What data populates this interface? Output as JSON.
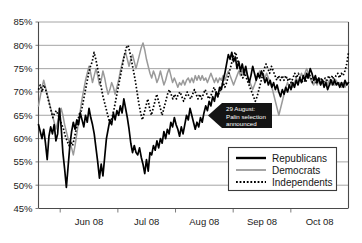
{
  "chart_data": {
    "type": "line",
    "title": "",
    "subtitle": "",
    "xlabel": "",
    "ylabel": "",
    "ylim": [
      45,
      85
    ],
    "ytick_values": [
      45,
      50,
      55,
      60,
      65,
      70,
      75,
      80,
      85
    ],
    "ytick_labels": [
      "45%",
      "50%",
      "55%",
      "60%",
      "65%",
      "70%",
      "75%",
      "80%",
      "85%"
    ],
    "xtick_labels": [
      "Jun 08",
      "Jul 08",
      "Aug 08",
      "Sep 08",
      "Oct 08"
    ],
    "x_range_note": "mid-May 2008 through late October 2008",
    "grid": true,
    "legend_position": "lower-right-inside",
    "annotations": [
      {
        "id": "palin-annotation",
        "line1": "29 August:",
        "line2": "Palin selection",
        "line3": "announced",
        "points_to_percent": 64,
        "style": "black-banner-left-arrow"
      }
    ],
    "series": [
      {
        "name": "Republicans",
        "style": "solid-black-thick",
        "color": "#000000",
        "values": [
          63.0,
          61.5,
          60.0,
          62.0,
          59.0,
          55.5,
          60.5,
          62.5,
          61.0,
          63.0,
          59.5,
          61.0,
          66.5,
          62.5,
          57.0,
          53.5,
          49.5,
          54.0,
          58.5,
          61.5,
          63.5,
          62.0,
          64.0,
          63.0,
          65.5,
          64.0,
          62.5,
          65.0,
          63.5,
          66.5,
          64.5,
          63.0,
          61.0,
          58.0,
          55.0,
          51.5,
          54.5,
          52.0,
          56.0,
          60.0,
          62.0,
          64.0,
          63.0,
          65.5,
          64.0,
          66.0,
          65.0,
          67.0,
          65.5,
          68.5,
          66.5,
          64.5,
          62.0,
          59.0,
          57.0,
          58.5,
          57.0,
          56.5,
          58.0,
          56.0,
          54.5,
          52.5,
          55.5,
          53.0,
          57.0,
          56.5,
          58.5,
          57.5,
          59.5,
          58.0,
          60.0,
          59.0,
          61.5,
          60.0,
          62.0,
          61.0,
          63.5,
          62.5,
          64.5,
          63.0,
          62.0,
          60.5,
          62.5,
          61.0,
          63.0,
          65.0,
          64.0,
          66.5,
          65.0,
          63.5,
          62.0,
          63.5,
          62.5,
          64.5,
          63.5,
          65.5,
          67.0,
          66.0,
          68.0,
          67.0,
          69.0,
          68.0,
          70.0,
          69.0,
          71.0,
          70.5,
          72.5,
          74.0,
          76.0,
          78.0,
          77.0,
          78.5,
          76.5,
          77.5,
          75.0,
          76.5,
          74.5,
          76.0,
          74.0,
          75.5,
          73.5,
          72.0,
          73.5,
          75.5,
          74.0,
          72.5,
          74.0,
          73.0,
          74.5,
          73.5,
          72.0,
          73.0,
          71.5,
          72.5,
          71.0,
          72.0,
          70.5,
          71.5,
          70.0,
          69.0,
          70.5,
          69.5,
          71.0,
          70.0,
          71.5,
          70.5,
          72.0,
          71.0,
          72.5,
          71.5,
          73.0,
          72.0,
          73.5,
          72.5,
          74.0,
          73.0,
          75.0,
          74.0,
          72.5,
          73.5,
          72.0,
          73.0,
          71.5,
          72.5,
          71.0,
          72.0,
          70.5,
          71.5,
          72.5,
          71.5,
          72.5,
          71.5,
          72.0,
          71.0,
          72.0,
          71.0,
          72.5,
          71.5,
          72.0
        ]
      },
      {
        "name": "Democrats",
        "style": "solid-gray-thin",
        "color": "#9a9a9a",
        "values": [
          67.0,
          69.0,
          71.0,
          72.5,
          71.0,
          69.5,
          68.0,
          66.5,
          65.0,
          63.5,
          62.0,
          63.5,
          65.0,
          66.5,
          65.0,
          63.0,
          61.5,
          60.0,
          59.0,
          58.0,
          56.5,
          58.5,
          61.0,
          63.5,
          66.0,
          68.5,
          70.5,
          72.5,
          74.0,
          75.5,
          74.0,
          72.0,
          73.5,
          75.0,
          73.5,
          71.5,
          72.5,
          74.5,
          73.0,
          71.0,
          69.5,
          70.5,
          72.0,
          71.0,
          69.5,
          71.0,
          72.5,
          74.5,
          76.0,
          77.5,
          78.5,
          77.0,
          75.5,
          77.0,
          78.0,
          76.5,
          75.0,
          76.5,
          78.0,
          79.5,
          80.5,
          79.0,
          77.0,
          75.5,
          74.0,
          73.0,
          74.5,
          73.5,
          72.0,
          73.0,
          74.5,
          73.0,
          71.5,
          72.5,
          74.0,
          75.0,
          73.5,
          72.0,
          73.0,
          72.0,
          71.0,
          72.0,
          71.5,
          72.5,
          71.5,
          72.5,
          73.0,
          72.0,
          73.0,
          72.0,
          73.5,
          72.5,
          73.5,
          72.5,
          73.5,
          72.5,
          73.0,
          72.0,
          73.0,
          74.0,
          73.0,
          72.0,
          73.0,
          72.0,
          73.0,
          72.5,
          73.5,
          72.5,
          73.5,
          74.5,
          73.5,
          72.5,
          71.5,
          72.5,
          73.5,
          74.5,
          73.5,
          74.5,
          73.5,
          74.5,
          73.5,
          72.5,
          71.5,
          70.5,
          71.5,
          72.5,
          73.5,
          74.5,
          73.5,
          74.0,
          73.0,
          74.0,
          73.0,
          72.0,
          71.0,
          69.5,
          68.0,
          66.5,
          65.0,
          66.5,
          68.0,
          69.5,
          71.0,
          72.0,
          71.0,
          72.0,
          71.0,
          72.0,
          73.0,
          72.0,
          73.0,
          74.0,
          73.0,
          74.0,
          75.0,
          74.0,
          73.0,
          72.0,
          71.5,
          72.5,
          71.5,
          72.5,
          71.5,
          72.5,
          71.5,
          72.5,
          71.5,
          72.5,
          71.5,
          72.5,
          71.5,
          72.5,
          71.5,
          72.0,
          71.0,
          72.0,
          71.0,
          72.0,
          71.5
        ]
      },
      {
        "name": "Independents",
        "style": "dotted-black",
        "color": "#000000",
        "values": [
          70.5,
          71.5,
          70.0,
          71.5,
          70.5,
          69.0,
          67.5,
          66.0,
          64.5,
          65.5,
          66.0,
          65.0,
          64.0,
          63.0,
          62.0,
          60.5,
          59.5,
          58.5,
          59.5,
          58.5,
          60.0,
          62.0,
          64.0,
          65.5,
          66.0,
          68.0,
          70.0,
          72.0,
          74.0,
          75.5,
          76.5,
          78.5,
          77.0,
          75.0,
          73.0,
          71.0,
          69.0,
          67.5,
          66.0,
          64.5,
          63.0,
          64.5,
          66.0,
          68.0,
          70.0,
          72.0,
          74.0,
          76.0,
          78.0,
          79.5,
          80.0,
          78.5,
          76.5,
          74.5,
          72.5,
          70.0,
          67.5,
          65.5,
          64.0,
          65.5,
          67.0,
          68.5,
          66.5,
          65.0,
          66.5,
          68.0,
          69.5,
          68.0,
          66.5,
          65.0,
          66.5,
          68.0,
          69.5,
          70.5,
          69.5,
          68.5,
          69.5,
          68.5,
          69.5,
          70.0,
          69.0,
          68.0,
          69.0,
          70.0,
          69.0,
          68.5,
          69.5,
          70.5,
          69.5,
          68.5,
          69.5,
          68.5,
          69.5,
          70.5,
          69.5,
          68.5,
          69.0,
          70.0,
          71.0,
          70.0,
          69.0,
          70.0,
          71.0,
          72.0,
          71.0,
          72.0,
          73.5,
          75.0,
          76.5,
          78.0,
          78.5,
          77.0,
          75.5,
          74.0,
          73.0,
          74.0,
          73.0,
          72.0,
          71.0,
          70.0,
          69.0,
          68.0,
          69.0,
          70.5,
          72.0,
          73.5,
          75.0,
          76.0,
          75.0,
          74.0,
          75.5,
          74.5,
          73.5,
          72.5,
          73.5,
          72.5,
          73.5,
          72.5,
          73.5,
          72.5,
          73.0,
          72.0,
          73.0,
          74.0,
          73.0,
          74.0,
          73.0,
          72.0,
          73.0,
          72.0,
          73.0,
          74.0,
          73.0,
          72.0,
          73.0,
          72.0,
          73.0,
          72.0,
          73.0,
          72.0,
          73.0,
          72.5,
          73.5,
          72.5,
          73.5,
          72.5,
          73.5,
          74.0,
          73.0,
          74.0,
          73.5,
          74.5,
          76.0,
          78.5
        ]
      }
    ]
  },
  "legend": {
    "items": [
      {
        "label": "Republicans",
        "swatch": "solid-thick-black"
      },
      {
        "label": "Democrats",
        "swatch": "solid-thin-gray"
      },
      {
        "label": "Independents",
        "swatch": "dotted-black"
      }
    ]
  },
  "colors": {
    "republicans": "#000000",
    "democrats": "#9a9a9a",
    "independents": "#000000",
    "grid": "#8d8d8d",
    "axis": "#4a4a4a",
    "annotation_bg": "#141414",
    "annotation_text": "#ffffff",
    "background": "#ffffff"
  }
}
